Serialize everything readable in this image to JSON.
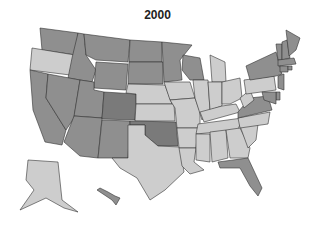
{
  "title": "2000",
  "colors": {
    "low": "#cdcdcd",
    "mid": "#8f8f8f",
    "high": "#7a7a7a",
    "outline": "#333333"
  },
  "chart_data": {
    "type": "choropleth",
    "title": "2000",
    "region": "United States",
    "categories": {
      "high": [
        "CO",
        "OK"
      ],
      "mid": [
        "WA",
        "ID",
        "MT",
        "WY",
        "ND",
        "SD",
        "MN",
        "WI",
        "CA",
        "NV",
        "UT",
        "AZ",
        "NM",
        "VA",
        "FL",
        "NY",
        "VT",
        "NH",
        "ME",
        "MA",
        "CT",
        "RI",
        "NJ",
        "DE",
        "MD",
        "HI"
      ],
      "low": [
        "OR",
        "NE",
        "KS",
        "IA",
        "MO",
        "IL",
        "IN",
        "OH",
        "MI",
        "KY",
        "TN",
        "AR",
        "LA",
        "MS",
        "AL",
        "GA",
        "SC",
        "NC",
        "WV",
        "PA",
        "TX",
        "AK"
      ]
    },
    "legend": "none shown"
  }
}
